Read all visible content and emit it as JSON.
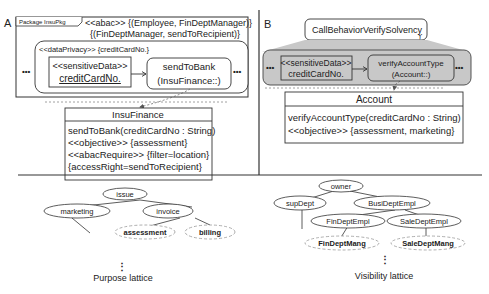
{
  "panelA": {
    "label": "A",
    "package_tag": "Package InsuPkg",
    "abac_line1": "<<abac>> {(Employee, FinDeptManager)}",
    "abac_line2": "{(FinDeptManager, sendToRecipient)}",
    "data_privacy": "<<dataPrivacy>> {creditCardNo.}",
    "ellipsis": "•••",
    "sensitive_stereotype": "<<sensitiveData>>",
    "sensitive_name": "creditCardNo.",
    "action_name": "sendToBank",
    "action_owner": "(InsuFinance::)",
    "class_name": "InsuFinance",
    "class_lines": [
      "sendToBank(creditCardNo : String)",
      "<<objective>> {assessment}",
      "<<abacRequire>> {filter=location}",
      " {accessRight=sendToRecipient}"
    ]
  },
  "panelB": {
    "label": "B",
    "call_behavior": "CallBehaviorVerifySolvency",
    "call_icon": "ⲩ",
    "ellipsis": "•••",
    "sensitive_stereotype": "<<sensitiveData>>",
    "sensitive_name": "creditCardNo.",
    "action_name": "verifyAccountType",
    "action_owner": "(Account::)",
    "class_name": "Account",
    "class_lines": [
      "verifyAccountType(creditCardNo : String)",
      "<<objective>> {assessment, marketing}"
    ],
    "shade_color": "#c8c8c8"
  },
  "purpose_lattice": {
    "caption": "Purpose lattice",
    "more": "⋮",
    "nodes": {
      "issue": "issue",
      "marketing": "marketing",
      "invoice": "invoice",
      "assessment": "assessment",
      "billing": "billing"
    }
  },
  "visibility_lattice": {
    "caption": "Visibility lattice",
    "more": "⋮",
    "nodes": {
      "owner": "owner",
      "supDept": "supDept",
      "busi": "BusiDeptEmpl",
      "fin": "FinDeptEmpl",
      "sale": "SaleDeptEmpl",
      "finMang": "FinDeptMang",
      "saleMang": "SaleDeptMang"
    }
  }
}
